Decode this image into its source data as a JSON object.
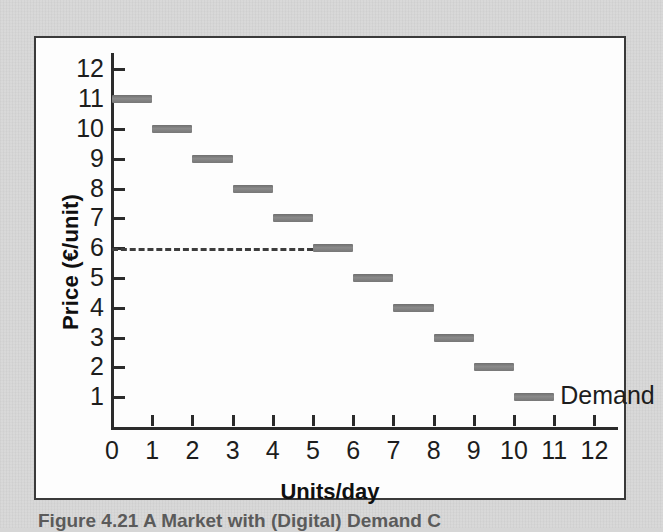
{
  "figure": {
    "caption": "Figure 4.21   A Market with (Digital) Demand C",
    "panel_background": "#fdfdfd",
    "page_background": "#d6d6d6",
    "border_color": "#3a3a3a"
  },
  "chart_data": {
    "type": "bar",
    "orientation": "horizontal-steps",
    "title": "",
    "xlabel": "Units/day",
    "ylabel": "Price (€/unit)",
    "xlim": [
      0,
      12.6
    ],
    "ylim": [
      0,
      12.6
    ],
    "xticks": [
      "0",
      "1",
      "2",
      "3",
      "4",
      "5",
      "6",
      "7",
      "8",
      "9",
      "10",
      "11",
      "12"
    ],
    "yticks": [
      "1",
      "2",
      "3",
      "4",
      "5",
      "6",
      "7",
      "8",
      "9",
      "10",
      "11",
      "12"
    ],
    "grid": false,
    "legend": {
      "position": "inside-bottom-right",
      "entries": [
        "Demand"
      ]
    },
    "series": [
      {
        "name": "Demand",
        "color": "#808080",
        "note": "step demand schedule; each segment spans one unit of quantity",
        "segments": [
          {
            "x_start": 0,
            "x_end": 1,
            "price": 11
          },
          {
            "x_start": 1,
            "x_end": 2,
            "price": 10
          },
          {
            "x_start": 2,
            "x_end": 3,
            "price": 9
          },
          {
            "x_start": 3,
            "x_end": 4,
            "price": 8
          },
          {
            "x_start": 4,
            "x_end": 5,
            "price": 7
          },
          {
            "x_start": 5,
            "x_end": 6,
            "price": 6
          },
          {
            "x_start": 6,
            "x_end": 7,
            "price": 5
          },
          {
            "x_start": 7,
            "x_end": 8,
            "price": 4
          },
          {
            "x_start": 8,
            "x_end": 9,
            "price": 3
          },
          {
            "x_start": 9,
            "x_end": 10,
            "price": 2
          },
          {
            "x_start": 10,
            "x_end": 11,
            "price": 1
          }
        ]
      }
    ],
    "annotations": [
      {
        "kind": "reference-line",
        "style": "dashed",
        "orientation": "horizontal",
        "value": 6,
        "x_start": 0,
        "x_end": 5,
        "label": ""
      },
      {
        "kind": "series-label",
        "text": "Demand",
        "x": 11.15,
        "y": 1
      }
    ]
  }
}
